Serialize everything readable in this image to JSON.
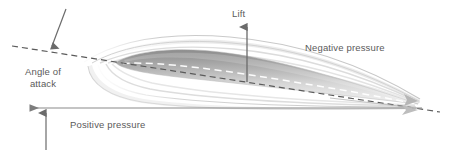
{
  "diagram": {
    "background_color": "#ffffff",
    "text_color": "#5a5a5a",
    "labels": {
      "lift": "Lift",
      "negative_pressure": "Negative pressure",
      "angle_of_attack_line1": "Angle of",
      "angle_of_attack_line2": "attack",
      "positive_pressure": "Positive pressure"
    },
    "annotations": [
      {
        "name": "lift-arrow",
        "label": "Lift",
        "direction": "up",
        "from": [
          247,
          82
        ],
        "to": [
          247,
          26
        ],
        "color": "#6b6b6b"
      },
      {
        "name": "angle-of-attack-arrow",
        "label": "Angle of attack",
        "direction": "down-left",
        "from": [
          65,
          10
        ],
        "to": [
          51,
          47
        ],
        "color": "#6b6b6b"
      },
      {
        "name": "positive-pressure-arrow",
        "label": "Positive pressure",
        "direction": "up",
        "from": [
          46,
          148
        ],
        "to": [
          46,
          112
        ],
        "color": "#6b6b6b"
      },
      {
        "name": "freestream-arrow",
        "label": "",
        "direction": "left",
        "from": [
          420,
          108
        ],
        "to": [
          28,
          108
        ],
        "color": "#8a8a8a"
      }
    ],
    "airfoil": {
      "name": "airfoil-body",
      "leading_edge": [
        115,
        62
      ],
      "trailing_edge": [
        418,
        104
      ],
      "fill_top_color": "#949494",
      "fill_bottom_color": "#ededed",
      "chord_line_color": "#ffffff",
      "chord_line_style": "dashed"
    },
    "reference_line": {
      "name": "angle-reference-dashed-line",
      "from": [
        12,
        46
      ],
      "to": [
        440,
        112
      ],
      "color": "#555555",
      "style": "dashed"
    },
    "streamlines": {
      "upper_count": 4,
      "lower_count": 4,
      "color": "#cfcfcf"
    }
  }
}
